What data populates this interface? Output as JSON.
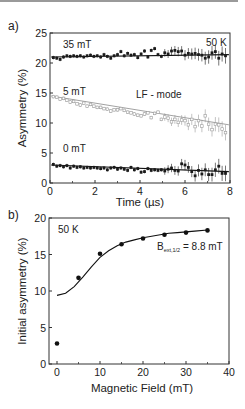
{
  "chart_data": [
    {
      "panel": "a)",
      "type": "scatter",
      "title": "",
      "xlabel": "Time (µs)",
      "ylabel": "Asymmetry (%)",
      "xlim": [
        0,
        8
      ],
      "ylim": [
        0,
        25
      ],
      "xticks": [
        0,
        2,
        4,
        6,
        8
      ],
      "yticks": [
        0,
        5,
        10,
        15,
        20,
        25
      ],
      "grid": false,
      "annotations": [
        "50 K",
        "LF - mode",
        "35 mT",
        "5 mT",
        "0 mT"
      ],
      "series": [
        {
          "name": "35 mT",
          "color": "#1a1a1a",
          "fit": {
            "start": 21.0,
            "end": 21.4
          },
          "x": [
            0.15,
            0.3,
            0.45,
            0.6,
            0.75,
            0.9,
            1.05,
            1.2,
            1.35,
            1.5,
            1.65,
            1.8,
            1.95,
            2.1,
            2.25,
            2.4,
            2.55,
            2.7,
            2.85,
            3.0,
            3.15,
            3.3,
            3.45,
            3.6,
            3.75,
            3.9,
            4.05,
            4.2,
            4.35,
            4.5,
            4.65,
            4.8,
            4.95,
            5.1,
            5.25,
            5.4,
            5.55,
            5.7,
            5.85,
            6.0,
            6.15,
            6.3,
            6.45,
            6.6,
            6.75,
            6.9,
            7.05,
            7.2,
            7.35,
            7.5,
            7.65,
            7.8
          ],
          "values": [
            20.9,
            20.8,
            20.6,
            21.0,
            21.2,
            21.1,
            21.2,
            21.1,
            21.2,
            21.0,
            21.2,
            21.3,
            21.1,
            21.2,
            21.0,
            21.4,
            21.1,
            20.8,
            21.2,
            21.4,
            21.9,
            21.2,
            21.6,
            21.3,
            21.4,
            20.9,
            21.5,
            22.0,
            21.0,
            22.1,
            22.4,
            21.4,
            21.1,
            21.7,
            21.5,
            22.0,
            22.1,
            21.9,
            22.0,
            21.3,
            21.6,
            21.5,
            21.6,
            21.4,
            21.3,
            20.8,
            21.0,
            21.7,
            21.9,
            20.8,
            21.5,
            21.2
          ]
        },
        {
          "name": "5 mT",
          "color": "#9a9a9a",
          "fit": {
            "start": 14.5,
            "end": 9.7
          },
          "x": [
            0.15,
            0.3,
            0.45,
            0.6,
            0.75,
            0.9,
            1.05,
            1.2,
            1.35,
            1.5,
            1.65,
            1.8,
            1.95,
            2.1,
            2.25,
            2.4,
            2.55,
            2.7,
            2.85,
            3.0,
            3.15,
            3.3,
            3.45,
            3.6,
            3.75,
            3.9,
            4.05,
            4.2,
            4.35,
            4.5,
            4.65,
            4.8,
            4.95,
            5.1,
            5.25,
            5.4,
            5.55,
            5.7,
            5.85,
            6.0,
            6.15,
            6.3,
            6.45,
            6.6,
            6.75,
            6.9,
            7.05,
            7.2,
            7.35,
            7.5,
            7.65,
            7.8
          ],
          "values": [
            14.4,
            14.3,
            14.0,
            14.1,
            13.8,
            13.5,
            13.6,
            13.2,
            13.0,
            13.3,
            12.8,
            13.1,
            12.8,
            12.6,
            12.6,
            12.4,
            12.3,
            12.0,
            12.2,
            12.2,
            12.4,
            12.1,
            11.8,
            11.7,
            11.5,
            11.3,
            11.2,
            11.5,
            11.7,
            10.9,
            11.6,
            11.8,
            10.6,
            11.0,
            10.8,
            10.2,
            10.6,
            10.1,
            10.5,
            10.4,
            9.7,
            10.6,
            9.4,
            10.4,
            9.5,
            11.2,
            9.8,
            8.9,
            9.8,
            9.7,
            9.0,
            8.4
          ]
        },
        {
          "name": "0 mT",
          "color": "#1a1a1a",
          "fit": {
            "start": 3.0,
            "end": 1.9
          },
          "x": [
            0.15,
            0.3,
            0.45,
            0.6,
            0.75,
            0.9,
            1.05,
            1.2,
            1.35,
            1.5,
            1.65,
            1.8,
            1.95,
            2.1,
            2.25,
            2.4,
            2.55,
            2.7,
            2.85,
            3.0,
            3.15,
            3.3,
            3.45,
            3.6,
            3.75,
            3.9,
            4.05,
            4.2,
            4.35,
            4.5,
            4.65,
            4.8,
            4.95,
            5.1,
            5.25,
            5.4,
            5.55,
            5.7,
            5.85,
            6.0,
            6.15,
            6.3,
            6.45,
            6.6,
            6.75,
            6.9,
            7.05,
            7.2,
            7.35,
            7.5,
            7.65,
            7.8
          ],
          "values": [
            3.1,
            2.8,
            2.9,
            2.7,
            2.9,
            2.5,
            2.8,
            2.6,
            2.7,
            2.5,
            2.6,
            2.5,
            2.6,
            2.5,
            2.4,
            2.5,
            2.2,
            2.5,
            2.6,
            2.3,
            2.5,
            2.3,
            2.1,
            2.6,
            2.2,
            2.4,
            1.8,
            1.9,
            2.4,
            2.1,
            2.2,
            2.1,
            2.2,
            2.0,
            2.3,
            2.5,
            2.1,
            2.0,
            3.2,
            3.0,
            2.6,
            1.9,
            1.2,
            2.1,
            1.5,
            2.2,
            1.4,
            1.4,
            2.2,
            2.8,
            1.6,
            1.6
          ]
        }
      ]
    },
    {
      "panel": "b)",
      "type": "scatter",
      "title": "",
      "xlabel": "Magnetic Field (mT)",
      "ylabel": "Initial asymmetry (%)",
      "xlim": [
        -2,
        40
      ],
      "ylim": [
        0,
        20
      ],
      "xticks": [
        0,
        10,
        20,
        30,
        40
      ],
      "yticks": [
        0,
        5,
        10,
        15,
        20
      ],
      "grid": false,
      "annotations": [
        "50 K",
        "B_ext,1/2 = 8.8 mT"
      ],
      "series": [
        {
          "name": "data",
          "color": "#111111",
          "x": [
            0,
            5,
            10,
            15,
            20,
            25,
            30,
            35
          ],
          "values": [
            2.8,
            11.8,
            15.1,
            16.4,
            17.2,
            17.7,
            18.0,
            18.3
          ]
        }
      ],
      "fit": {
        "name": "fit",
        "B_half_mT": 8.8,
        "x": [
          0,
          2,
          4,
          6,
          8,
          10,
          12,
          14,
          16,
          18,
          20,
          22,
          24,
          26,
          28,
          30,
          32,
          35
        ],
        "values": [
          9.4,
          9.7,
          10.6,
          11.9,
          13.3,
          14.6,
          15.5,
          16.2,
          16.7,
          17.0,
          17.3,
          17.5,
          17.7,
          17.9,
          18.0,
          18.1,
          18.2,
          18.35
        ]
      }
    }
  ],
  "labels": {
    "panel_a": "a)",
    "panel_b": "b)",
    "a_xlabel": "Time (µs)",
    "a_ylabel": "Asymmetry (%)",
    "a_temp": "50 K",
    "a_mode": "LF - mode",
    "a_s1": "35 mT",
    "a_s2": "5 mT",
    "a_s3": "0 mT",
    "b_xlabel": "Magnetic Field (mT)",
    "b_ylabel": "Initial asymmetry (%)",
    "b_temp": "50 K",
    "b_bhalf_main": "B",
    "b_bhalf_sub": "ext,1/2",
    "b_bhalf_val": " = 8.8 mT"
  }
}
